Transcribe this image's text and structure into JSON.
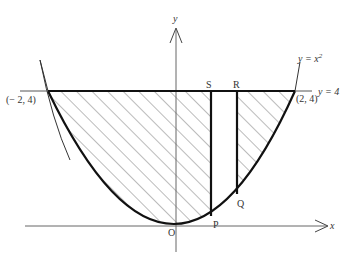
{
  "diagram": {
    "curve_label": "y = x²",
    "curve_label_base": "y = x",
    "curve_label_exp": "2",
    "line_label": "y = 4",
    "axis_x_label": "x",
    "axis_y_label": "y",
    "origin_label": "O",
    "points": {
      "left_intersection": "(− 2, 4)",
      "right_intersection": "(2, 4)",
      "S": "S",
      "R": "R",
      "P": "P",
      "Q": "Q"
    },
    "colors": {
      "curve": "#111111",
      "axis": "#555555",
      "hatch": "#555555",
      "text": "#333333"
    }
  }
}
